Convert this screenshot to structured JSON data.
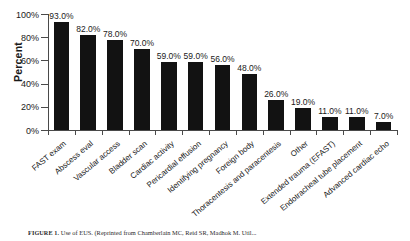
{
  "chart_data": {
    "type": "bar",
    "title": "",
    "xlabel": "",
    "ylabel": "Percent",
    "ylim": [
      0,
      100
    ],
    "ytick_labels": [
      "0%",
      "20%",
      "40%",
      "60%",
      "80%",
      "100%"
    ],
    "ytick_values": [
      0,
      20,
      40,
      60,
      80,
      100
    ],
    "grid": false,
    "legend": null,
    "bar_color": "#121212",
    "categories": [
      "FAST exam",
      "Abscess eval",
      "Vascular access",
      "Bladder scan",
      "Cardiac activity",
      "Pericardial effusion",
      "Identifying pregnancy",
      "Foreign body",
      "Thoracentesis and paracentesis",
      "Other",
      "Extended trauma (EFAST)",
      "Endotracheal tube placement",
      "Advanced cardiac echo"
    ],
    "values": [
      93.0,
      82.0,
      78.0,
      70.0,
      59.0,
      59.0,
      56.0,
      48.0,
      26.0,
      19.0,
      11.0,
      11.0,
      7.0
    ],
    "data_labels": [
      "93.0%",
      "82.0%",
      "78.0%",
      "70.0%",
      "59.0%",
      "59.0%",
      "56.0%",
      "48.0%",
      "26.0%",
      "19.0%",
      "11.0%",
      "11.0%",
      "7.0%"
    ]
  },
  "caption": {
    "label": "FIGURE 1.",
    "text": "Use of EUS. (Reprinted from Chamberlain MC, Reid SR, Madhok M. Util..."
  }
}
